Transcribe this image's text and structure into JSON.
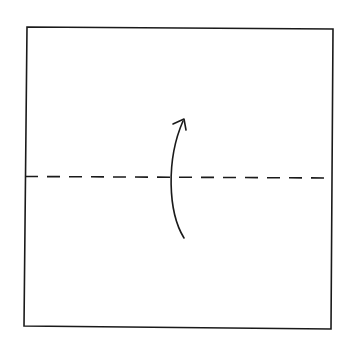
{
  "diagram": {
    "type": "origami-fold-step",
    "colors": {
      "background": "#ffffff",
      "stroke": "#1a1a1a"
    },
    "elements": {
      "paper": {
        "label": "square-paper"
      },
      "fold_line": {
        "label": "valley-fold-line",
        "style": "dashed"
      },
      "arrow": {
        "label": "fold-direction-arrow",
        "direction": "up"
      }
    }
  }
}
